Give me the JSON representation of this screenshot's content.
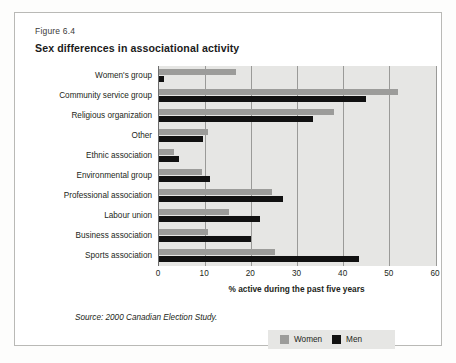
{
  "figure": {
    "label": "Figure 6.4",
    "title": "Sex differences in associational activity",
    "source": "Source: 2000 Canadian Election Study."
  },
  "legend": {
    "women_label": "Women",
    "men_label": "Men",
    "women_color": "#9c9c9a",
    "men_color": "#111111"
  },
  "chart_data": {
    "type": "bar",
    "orientation": "horizontal",
    "title": "Sex differences in associational activity",
    "xlabel": "% active during the past five years",
    "ylabel": "",
    "xlim": [
      0,
      60
    ],
    "xticks": [
      0,
      10,
      20,
      30,
      40,
      50,
      60
    ],
    "grid": true,
    "legend_position": "bottom-right",
    "categories": [
      "Women's group",
      "Community service group",
      "Religious organization",
      "Other",
      "Ethnic association",
      "Environmental group",
      "Professional association",
      "Labour union",
      "Business association",
      "Sports association"
    ],
    "series": [
      {
        "name": "Women",
        "color": "#9c9c9a",
        "values": [
          16.7,
          51.7,
          37.9,
          10.6,
          3.3,
          9.3,
          24.5,
          15.1,
          10.6,
          25.1
        ]
      },
      {
        "name": "Men",
        "color": "#111111",
        "values": [
          1.0,
          44.8,
          33.4,
          9.5,
          4.3,
          11.1,
          26.8,
          21.9,
          19.9,
          43.3
        ]
      }
    ]
  }
}
